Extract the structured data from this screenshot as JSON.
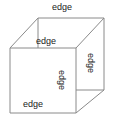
{
  "figure": {
    "name": "cube-edge-diagram",
    "shape": "cube",
    "stroke_color": "#8a8a8a",
    "fill_color": "#ffffff",
    "background_color": "#ffffff",
    "text_color": "#1a1a1a"
  },
  "labels": {
    "top": "edge",
    "upper": "edge",
    "right": "edge",
    "center": "edge",
    "bottom": "edge"
  },
  "geometry": {
    "front_face": [
      [
        10,
        48
      ],
      [
        76,
        48
      ],
      [
        76,
        113
      ],
      [
        10,
        113
      ]
    ],
    "back_face": [
      [
        38,
        18
      ],
      [
        104,
        18
      ],
      [
        104,
        90
      ],
      [
        38,
        90
      ]
    ],
    "visible_connectors": [
      [
        [
          10,
          48
        ],
        [
          38,
          18
        ]
      ],
      [
        [
          76,
          48
        ],
        [
          104,
          18
        ]
      ],
      [
        [
          76,
          113
        ],
        [
          104,
          90
        ]
      ]
    ]
  }
}
